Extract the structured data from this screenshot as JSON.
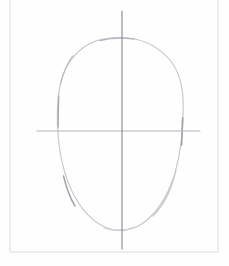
{
  "artwork": {
    "title": "Pencil head construction sketch",
    "medium": "graphite pencil on white paper",
    "subject": "face proportion guide",
    "background_color": "#ffffff",
    "paper_color": "#fefefe"
  },
  "frame": {
    "name": "paper border",
    "color": "#dcdcdc",
    "stroke_width": 1,
    "left_x": 10,
    "right_x": 218,
    "bottom_y": 252,
    "top_y": -2
  },
  "oval": {
    "name": "head outline",
    "color": "#c3c3cb",
    "dark_color": "#9b9ba6",
    "stroke_width": 1.1,
    "left_x": 57,
    "right_x": 183,
    "top_y": 37,
    "bottom_y": 230,
    "center_x": 120,
    "widest_y": 118,
    "path": "M 120.5,37.5 C 141,37.8 158,46 170,60 C 179,71 183,86 183.2,104 C 183.5,127 181,152 175,173 C 168,197 155,216 140,225 C 131,230 121,231.5 112,229.5 C 98,226 84,214 75,197 C 66,181 60.5,160 58.3,138 C 56.5,118 57,98 61,81 C 66,62 79,47 96,41 C 104,38.2 112,37.4 120.5,37.5 Z"
  },
  "vertical_guideline": {
    "name": "center vertical axis",
    "color": "#8e8e96",
    "stroke_width": 1.2,
    "x": 122,
    "y_start": 11,
    "y_end": 249
  },
  "horizontal_guideline": {
    "name": "eye line horizontal axis",
    "color": "#b3b3bb",
    "stroke_width": 1.1,
    "y": 131,
    "x_start": 37,
    "x_end": 200
  },
  "accents": [
    {
      "name": "left-edge-dark-segment",
      "path": "M 58.6,96 L 58.1,127",
      "color": "#a9a9b4",
      "width": 1.4
    },
    {
      "name": "lower-left-dark-segment",
      "path": "M 63.5,176 C 66.5,188 70,198 75,206",
      "color": "#a3a3ae",
      "width": 1.5
    },
    {
      "name": "right-edge-dark-segment",
      "path": "M 182.6,118 L 181.6,145",
      "color": "#a0a0ac",
      "width": 1.6
    },
    {
      "name": "upper-left-light-segment",
      "path": "M 60.5,84 C 63,74 67,64 72.5,56",
      "color": "#bcbcc6",
      "width": 1.2
    },
    {
      "name": "crown-segment",
      "path": "M 100,40.5 C 110,38.2 122,37.6 134,39",
      "color": "#b4b4be",
      "width": 1.3
    },
    {
      "name": "chin-segment",
      "path": "M 104,228 C 112,231 124,231 134,227.5",
      "color": "#cfcfd6",
      "width": 1.2
    },
    {
      "name": "lower-right-segment",
      "path": "M 176,170 C 172,188 164,205 153,216",
      "color": "#c9c9d1",
      "width": 1.2
    }
  ]
}
